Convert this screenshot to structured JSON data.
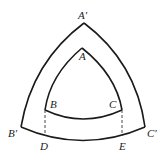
{
  "diagram": {
    "stroke_color": "#1a1a1a",
    "background": "#ffffff",
    "outer_triangle": {
      "vertices": {
        "A_prime": {
          "label": "A′",
          "x": 84,
          "y": 23
        },
        "B_prime": {
          "label": "B′",
          "x": 21,
          "y": 127
        },
        "C_prime": {
          "label": "C′",
          "x": 145,
          "y": 127
        }
      }
    },
    "inner_triangle": {
      "vertices": {
        "A": {
          "label": "A",
          "x": 82,
          "y": 48
        },
        "B": {
          "label": "B",
          "x": 45,
          "y": 110
        },
        "C": {
          "label": "C",
          "x": 122,
          "y": 110
        }
      }
    },
    "foot_points": {
      "D": {
        "label": "D",
        "x": 45,
        "y": 135
      },
      "E": {
        "label": "E",
        "x": 122,
        "y": 135
      }
    },
    "labels": {
      "A_prime": "A′",
      "A": "A",
      "B": "B",
      "C": "C",
      "B_prime": "B′",
      "C_prime": "C′",
      "D": "D",
      "E": "E"
    }
  }
}
